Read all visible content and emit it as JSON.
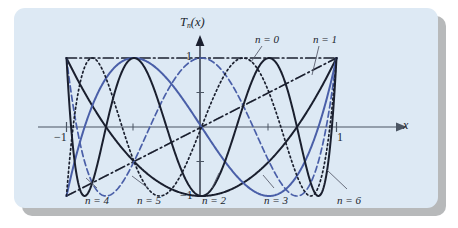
{
  "figure": {
    "kind": "chart-figure",
    "panel_background": "#dde9f4",
    "shadow_color": "#b7b9ba",
    "page_background": "#ffffff"
  },
  "axes": {
    "y_axis_label_main": "T",
    "y_axis_label_sub": "n",
    "y_axis_label_arg": "(x)",
    "x_axis_label": "x",
    "x_ticks": [
      {
        "value": -1,
        "label": "−1"
      },
      {
        "value": -0.5,
        "label": ""
      },
      {
        "value": 0.5,
        "label": ""
      },
      {
        "value": 1,
        "label": "1"
      }
    ],
    "y_ticks": [
      {
        "value": 1,
        "label": "1"
      },
      {
        "value": 0.5,
        "label": ""
      },
      {
        "value": -0.5,
        "label": ""
      },
      {
        "value": -1,
        "label": "−1"
      }
    ]
  },
  "callouts": [
    {
      "id": "n0",
      "text": "n = 0"
    },
    {
      "id": "n1",
      "text": "n = 1"
    },
    {
      "id": "n4",
      "text": "n = 4"
    },
    {
      "id": "n5",
      "text": "n = 5"
    },
    {
      "id": "n2",
      "text": "n = 2"
    },
    {
      "id": "n3",
      "text": "n = 3"
    },
    {
      "id": "n6",
      "text": "n = 6"
    }
  ],
  "chart_data": {
    "type": "line",
    "title": "",
    "subtitle": "",
    "xlabel": "x",
    "ylabel": "T_n(x)",
    "xlim": [
      -1,
      1
    ],
    "ylim": [
      -1,
      1
    ],
    "grid": false,
    "legend_position": "callout-labels",
    "xticks": [
      -1,
      -0.5,
      0.5,
      1
    ],
    "xticklabels": [
      "−1",
      "",
      "",
      "1"
    ],
    "yticks": [
      -1,
      -0.5,
      0.5,
      1
    ],
    "yticklabels": [
      "−1",
      "",
      "",
      "1"
    ],
    "annotations": [
      "n = 0",
      "n = 1",
      "n = 2",
      "n = 3",
      "n = 4",
      "n = 5",
      "n = 6"
    ],
    "series": [
      {
        "name": "n = 0",
        "formula": "T0(x) = 1",
        "color": "#1a1f2e",
        "style": "dashdot",
        "degree": 0
      },
      {
        "name": "n = 1",
        "formula": "T1(x) = x",
        "color": "#1a1f2e",
        "style": "dashdot",
        "degree": 1
      },
      {
        "name": "n = 2",
        "formula": "T2(x) = 2x^2 - 1",
        "color": "#1a1f2e",
        "style": "solid",
        "degree": 2
      },
      {
        "name": "n = 3",
        "formula": "T3(x) = 4x^3 - 3x",
        "color": "#4a5fa8",
        "style": "solid",
        "degree": 3
      },
      {
        "name": "n = 4",
        "formula": "T4(x) = 8x^4 - 8x^2 + 1",
        "color": "#4a5fa8",
        "style": "dashed",
        "degree": 4
      },
      {
        "name": "n = 5",
        "formula": "T5(x) = 16x^5 - 20x^3 + 5x",
        "color": "#1a1f2e",
        "style": "dotted",
        "degree": 5
      },
      {
        "name": "n = 6",
        "formula": "T6(x) = 32x^6 - 48x^4 + 18x^2 - 1",
        "color": "#1a1f2e",
        "style": "solid",
        "degree": 6
      }
    ]
  }
}
